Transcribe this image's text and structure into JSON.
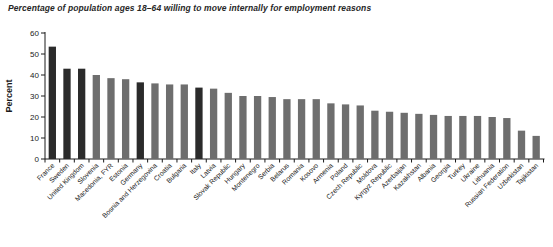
{
  "chart_data": {
    "type": "bar",
    "title": "Percentage of population ages 18–64 willing to move internally for employment reasons",
    "xlabel": "",
    "ylabel": "Percent",
    "ylim": [
      0,
      60
    ],
    "yticks": [
      0,
      10,
      20,
      30,
      40,
      50,
      60
    ],
    "grid": false,
    "legend": null,
    "bar_colors": {
      "default": "#6e6e6e",
      "highlight": "#2b2b2b"
    },
    "axis_color": "#1a1a1a",
    "highlighted_categories": [
      "France",
      "Sweden",
      "United Kingdom",
      "Germany",
      "Italy"
    ],
    "categories": [
      "France",
      "Sweden",
      "United Kingdom",
      "Slovenia",
      "Macedonia, FYR",
      "Estonia",
      "Germany",
      "Bosnia and Herzegovina",
      "Croatia",
      "Bulgaria",
      "Italy",
      "Latvia",
      "Slovak Republic",
      "Hungary",
      "Montenegro",
      "Serbia",
      "Belarus",
      "Romania",
      "Kosovo",
      "Armenia",
      "Poland",
      "Czech Republic",
      "Moldova",
      "Kyrgyz Republic",
      "Azerbaijan",
      "Kazakhstan",
      "Albania",
      "Georgia",
      "Turkey",
      "Ukraine",
      "Lithuania",
      "Russian Federation",
      "Uzbekistan",
      "Tajikistan"
    ],
    "values": [
      53.5,
      43,
      43,
      40,
      38.5,
      38,
      36.5,
      36,
      35.5,
      35.5,
      34,
      33.5,
      31.5,
      30,
      30,
      29.5,
      28.5,
      28.5,
      28.5,
      26.5,
      26,
      25.5,
      23,
      22.5,
      22,
      21.5,
      21,
      20.5,
      20.5,
      20.5,
      20,
      19.5,
      13.5,
      11
    ]
  }
}
